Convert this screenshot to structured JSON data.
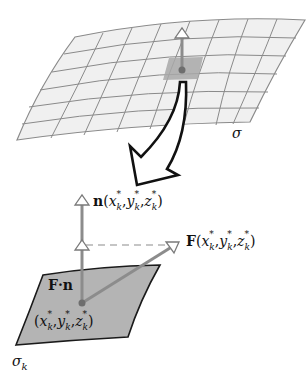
{
  "figure": {
    "type": "surface-flux-diagram",
    "surface_label": "σ",
    "patch_label": "σ",
    "patch_label_subscript": "k",
    "normal_vector_label": {
      "symbol": "n",
      "args": [
        "x",
        "y",
        "z"
      ],
      "subscript": "k",
      "superscript": "*"
    },
    "field_vector_label": {
      "symbol": "F",
      "args": [
        "x",
        "y",
        "z"
      ],
      "subscript": "k",
      "superscript": "*"
    },
    "dot_product_label": "F·n",
    "point_label": {
      "args": [
        "x",
        "y",
        "z"
      ],
      "subscript": "k",
      "superscript": "*"
    },
    "colors": {
      "grid_fill": "#f0f0f0",
      "grid_line": "#8a8a8a",
      "highlight_cell": "#a8a8a8",
      "patch_fill": "#b4b4b4",
      "patch_edge": "#1a1a1a",
      "vector": "#8c8c8c",
      "point": "#6e6e6e",
      "curved_arrow_outline": "#111111"
    }
  }
}
